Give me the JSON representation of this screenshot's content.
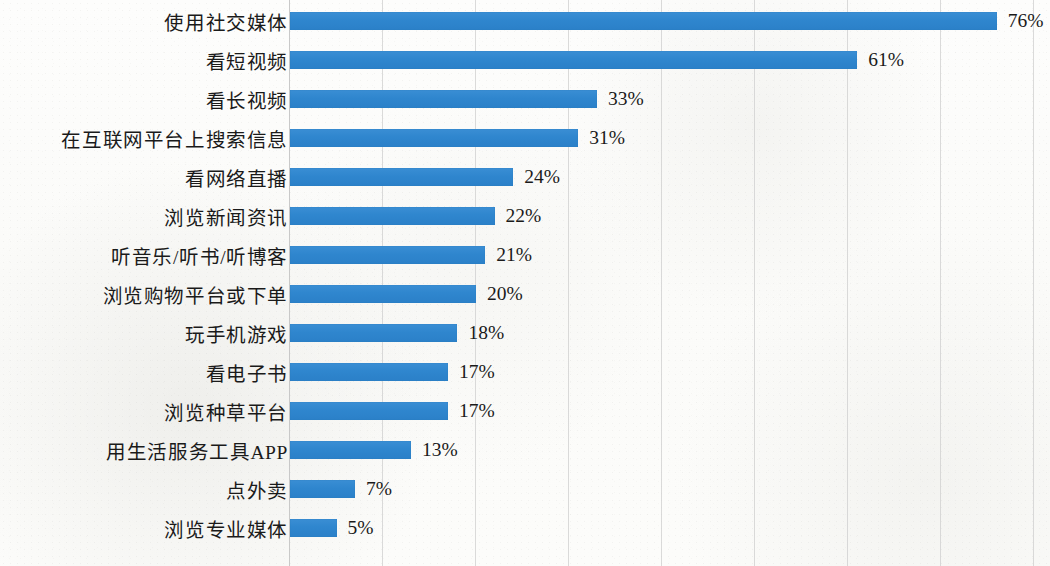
{
  "chart_data": {
    "type": "bar",
    "orientation": "horizontal",
    "title": "",
    "subtitle": "",
    "xlabel": "",
    "ylabel": "",
    "xlim": [
      0,
      80
    ],
    "x_tick_values": [
      0,
      10,
      20,
      30,
      40,
      50,
      60,
      70,
      80
    ],
    "grid": "vertical-only",
    "legend": "none",
    "value_suffix": "%",
    "bar_color": "#2f86ce",
    "gridline_color": "#cfcfcf",
    "background_color": "#fdfdfc",
    "text_color": "#1a1a1a",
    "categories": [
      "使用社交媒体",
      "看短视频",
      "看长视频",
      "在互联网平台上搜索信息",
      "看网络直播",
      "浏览新闻资讯",
      "听音乐/听书/听博客",
      "浏览购物平台或下单",
      "玩手机游戏",
      "看电子书",
      "浏览种草平台",
      "用生活服务工具APP",
      "点外卖",
      "浏览专业媒体"
    ],
    "values": [
      76,
      61,
      33,
      31,
      24,
      22,
      21,
      20,
      18,
      17,
      17,
      13,
      7,
      5
    ],
    "value_labels": [
      "76%",
      "61%",
      "33%",
      "31%",
      "24%",
      "22%",
      "21%",
      "20%",
      "18%",
      "17%",
      "17%",
      "13%",
      "7%",
      "5%"
    ]
  }
}
